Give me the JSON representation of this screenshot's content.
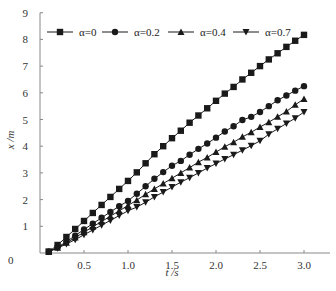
{
  "chart_data": {
    "type": "line",
    "title": "",
    "xlabel": "t /s",
    "ylabel": "x /m",
    "xlim": [
      0,
      3.25
    ],
    "ylim": [
      0,
      9
    ],
    "x_ticks": [
      0.5,
      1.0,
      1.5,
      2.0,
      2.5,
      3.0
    ],
    "x_tick_labels": [
      "0.5",
      "1.0",
      "1.5",
      "2.0",
      "2.5",
      "3.0"
    ],
    "y_ticks": [
      0,
      1,
      2,
      3,
      4,
      5,
      6,
      7,
      8,
      9
    ],
    "y_tick_labels": [
      "0",
      "1",
      "2",
      "3",
      "4",
      "5",
      "6",
      "7",
      "8",
      "9"
    ],
    "origin_label": "0",
    "grid": false,
    "legend_position": "top, inside, horizontal",
    "x": [
      0.1,
      0.2,
      0.3,
      0.4,
      0.5,
      0.6,
      0.7,
      0.8,
      0.9,
      1.0,
      1.1,
      1.2,
      1.3,
      1.4,
      1.5,
      1.6,
      1.7,
      1.8,
      1.9,
      2.0,
      2.1,
      2.2,
      2.3,
      2.4,
      2.5,
      2.6,
      2.7,
      2.8,
      2.9,
      3.0
    ],
    "series": [
      {
        "name": "α=0",
        "marker": "square",
        "values": [
          0.05,
          0.3,
          0.6,
          0.9,
          1.2,
          1.5,
          1.8,
          2.1,
          2.4,
          2.7,
          3.02,
          3.36,
          3.7,
          4.0,
          4.3,
          4.58,
          4.88,
          5.15,
          5.42,
          5.7,
          5.97,
          6.22,
          6.5,
          6.75,
          7.0,
          7.25,
          7.48,
          7.72,
          7.95,
          8.17
        ]
      },
      {
        "name": "α=0.2",
        "marker": "circle",
        "values": [
          0.05,
          0.22,
          0.42,
          0.65,
          0.88,
          1.1,
          1.32,
          1.54,
          1.75,
          1.95,
          2.22,
          2.5,
          2.78,
          3.03,
          3.27,
          3.45,
          3.68,
          3.9,
          4.1,
          4.32,
          4.55,
          4.75,
          4.98,
          5.1,
          5.28,
          5.5,
          5.72,
          5.9,
          6.08,
          6.25
        ]
      },
      {
        "name": "α=0.4",
        "marker": "triangle-up",
        "values": [
          0.05,
          0.2,
          0.38,
          0.58,
          0.78,
          0.98,
          1.18,
          1.38,
          1.58,
          1.78,
          1.98,
          2.2,
          2.4,
          2.6,
          2.8,
          3.0,
          3.2,
          3.4,
          3.58,
          3.78,
          3.98,
          4.15,
          4.35,
          4.52,
          4.72,
          4.9,
          5.1,
          5.3,
          5.55,
          5.77
        ]
      },
      {
        "name": "α=0.7",
        "marker": "triangle-down",
        "values": [
          0.05,
          0.18,
          0.34,
          0.5,
          0.68,
          0.86,
          1.04,
          1.22,
          1.4,
          1.58,
          1.72,
          1.9,
          2.1,
          2.28,
          2.47,
          2.65,
          2.82,
          3.0,
          3.18,
          3.35,
          3.52,
          3.68,
          3.85,
          4.02,
          4.2,
          4.45,
          4.65,
          4.85,
          5.05,
          5.28
        ]
      }
    ]
  },
  "legend": {
    "items": [
      {
        "label": "α=0",
        "marker": "square"
      },
      {
        "label": "α=0.2",
        "marker": "circle"
      },
      {
        "label": "α=0.4",
        "marker": "triangle-up"
      },
      {
        "label": "α=0.7",
        "marker": "triangle-down"
      }
    ]
  },
  "axes": {
    "x_title": "t /s",
    "y_title": "x /m",
    "origin": "0"
  },
  "colors": {
    "line": "#1a1a1a",
    "axis": "#888888",
    "text": "#333333"
  }
}
